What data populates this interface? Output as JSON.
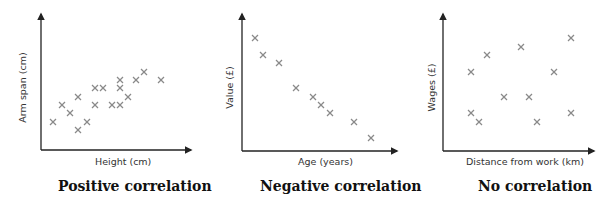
{
  "chart_data": [
    {
      "type": "scatter",
      "title": "Positive correlation",
      "xlabel": "Height (cm)",
      "ylabel": "Arm span (cm)",
      "grid": false,
      "marker": "x",
      "marker_color": "#8a8a8a",
      "points": [
        [
          53,
          122
        ],
        [
          62,
          105
        ],
        [
          70,
          113
        ],
        [
          78,
          97
        ],
        [
          78,
          130
        ],
        [
          87,
          122
        ],
        [
          95,
          88
        ],
        [
          95,
          105
        ],
        [
          103,
          88
        ],
        [
          112,
          105
        ],
        [
          120,
          80
        ],
        [
          120,
          88
        ],
        [
          120,
          105
        ],
        [
          128,
          97
        ],
        [
          136,
          80
        ],
        [
          144,
          72
        ],
        [
          161,
          80
        ]
      ]
    },
    {
      "type": "scatter",
      "title": "Negative correlation",
      "xlabel": "Age (years)",
      "ylabel": "Value (£)",
      "grid": false,
      "marker": "x",
      "marker_color": "#8a8a8a",
      "points": [
        [
          255,
          38
        ],
        [
          263,
          55
        ],
        [
          279,
          63
        ],
        [
          296,
          88
        ],
        [
          313,
          97
        ],
        [
          321,
          105
        ],
        [
          330,
          113
        ],
        [
          354,
          122
        ],
        [
          371,
          138
        ]
      ]
    },
    {
      "type": "scatter",
      "title": "No correlation",
      "xlabel": "Distance from work (km)",
      "ylabel": "Wages (£)",
      "grid": false,
      "marker": "x",
      "marker_color": "#8a8a8a",
      "points": [
        [
          471,
          72
        ],
        [
          487,
          55
        ],
        [
          521,
          47
        ],
        [
          571,
          38
        ],
        [
          554,
          72
        ],
        [
          504,
          97
        ],
        [
          529,
          97
        ],
        [
          471,
          113
        ],
        [
          479,
          122
        ],
        [
          537,
          122
        ],
        [
          571,
          113
        ]
      ]
    }
  ],
  "panels": [
    {
      "xlabel": "Height (cm)",
      "ylabel": "Arm span (cm)",
      "caption": "Positive correlation"
    },
    {
      "xlabel": "Age (years)",
      "ylabel": "Value (£)",
      "caption": "Negative correlation"
    },
    {
      "xlabel": "Distance from work (km)",
      "ylabel": "Wages (£)",
      "caption": "No correlation"
    }
  ],
  "colors": {
    "axis": "#222222",
    "marker": "#8a8a8a",
    "text": "#333333"
  }
}
